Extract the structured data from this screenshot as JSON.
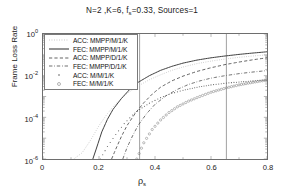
{
  "chart_data": {
    "type": "line",
    "title_parts": {
      "pre": "N=2 ,K=6, f",
      "sub": "s",
      "post": "=0.33, Sources=1"
    },
    "xlabel": "ρ",
    "xlabel_sub": "s",
    "ylabel": "Frame Loss Rate",
    "xlim": [
      0,
      0.8
    ],
    "ylim": [
      1e-06,
      1
    ],
    "yscale": "log",
    "xticks": [
      "0",
      "0.2",
      "0.4",
      "0.6",
      "0.8"
    ],
    "xtick_values": [
      0,
      0.2,
      0.4,
      0.6,
      0.8
    ],
    "yticks": [
      "10^0",
      "10^-2",
      "10^-4",
      "10^-6"
    ],
    "ytick_exponents": [
      "0",
      "-2",
      "-4",
      "-6"
    ],
    "ytick_values": [
      1,
      0.01,
      0.0001,
      1e-06
    ],
    "grid": false,
    "legend_position": "upper left",
    "vertical_reference_lines": [
      0.345,
      0.655
    ],
    "series": [
      {
        "name": "ACC: MMPP/M/1/K",
        "style": "dotted",
        "color": "#b9b9b9",
        "points": [
          [
            0.11,
            1e-06
          ],
          [
            0.14,
            2e-06
          ],
          [
            0.17,
            8e-06
          ],
          [
            0.2,
            4e-05
          ],
          [
            0.23,
            0.00015
          ],
          [
            0.26,
            0.00045
          ],
          [
            0.3,
            0.0014
          ],
          [
            0.34,
            0.0032
          ],
          [
            0.38,
            0.0064
          ],
          [
            0.42,
            0.011
          ],
          [
            0.46,
            0.018
          ],
          [
            0.5,
            0.026
          ],
          [
            0.55,
            0.038
          ],
          [
            0.6,
            0.05
          ],
          [
            0.65,
            0.063
          ],
          [
            0.7,
            0.076
          ],
          [
            0.75,
            0.088
          ],
          [
            0.8,
            0.1
          ]
        ]
      },
      {
        "name": "FEC: MMPP/M/1/K",
        "style": "solid",
        "color": "#3c3c3c",
        "points": [
          [
            0.178,
            1e-06
          ],
          [
            0.19,
            3e-06
          ],
          [
            0.21,
            2e-05
          ],
          [
            0.23,
            8e-05
          ],
          [
            0.25,
            0.00024
          ],
          [
            0.28,
            0.0008
          ],
          [
            0.31,
            0.0022
          ],
          [
            0.34,
            0.0048
          ],
          [
            0.38,
            0.01
          ],
          [
            0.42,
            0.018
          ],
          [
            0.46,
            0.028
          ],
          [
            0.5,
            0.04
          ],
          [
            0.55,
            0.056
          ],
          [
            0.6,
            0.072
          ],
          [
            0.65,
            0.088
          ],
          [
            0.7,
            0.105
          ],
          [
            0.75,
            0.122
          ],
          [
            0.8,
            0.14
          ]
        ]
      },
      {
        "name": "ACC: MMPP/D/1/K",
        "style": "dashed",
        "color": "#474747",
        "points": [
          [
            0.245,
            1e-06
          ],
          [
            0.26,
            3e-06
          ],
          [
            0.28,
            1.2e-05
          ],
          [
            0.3,
            4e-05
          ],
          [
            0.33,
            0.00016
          ],
          [
            0.36,
            0.0005
          ],
          [
            0.39,
            0.0013
          ],
          [
            0.42,
            0.0028
          ],
          [
            0.46,
            0.0056
          ],
          [
            0.5,
            0.0095
          ],
          [
            0.55,
            0.016
          ],
          [
            0.6,
            0.024
          ],
          [
            0.65,
            0.034
          ],
          [
            0.7,
            0.045
          ],
          [
            0.75,
            0.058
          ],
          [
            0.8,
            0.072
          ]
        ]
      },
      {
        "name": "FEC: MMPP/D/1/K",
        "style": "dashdot",
        "color": "#555555",
        "points": [
          [
            0.285,
            1e-06
          ],
          [
            0.3,
            3.5e-06
          ],
          [
            0.32,
            1.3e-05
          ],
          [
            0.34,
            4.2e-05
          ],
          [
            0.37,
            0.00015
          ],
          [
            0.4,
            0.00042
          ],
          [
            0.44,
            0.0011
          ],
          [
            0.48,
            0.0022
          ],
          [
            0.52,
            0.0038
          ],
          [
            0.56,
            0.0056
          ],
          [
            0.6,
            0.0076
          ],
          [
            0.65,
            0.01
          ],
          [
            0.7,
            0.0125
          ],
          [
            0.75,
            0.015
          ],
          [
            0.8,
            0.0175
          ]
        ]
      },
      {
        "name": "ACC: M/M/1/K",
        "style": "dot-marker",
        "color": "#5a5a5a",
        "points": [
          [
            0.205,
            1e-06
          ],
          [
            0.23,
            4e-06
          ],
          [
            0.26,
            1.5e-05
          ],
          [
            0.29,
            5e-05
          ],
          [
            0.32,
            0.00013
          ],
          [
            0.345,
            0.00024
          ],
          [
            0.38,
            0.00048
          ],
          [
            0.42,
            0.00088
          ],
          [
            0.46,
            0.0014
          ],
          [
            0.5,
            0.002
          ],
          [
            0.55,
            0.0028
          ],
          [
            0.6,
            0.0036
          ],
          [
            0.655,
            0.0044
          ],
          [
            0.7,
            0.005
          ],
          [
            0.75,
            0.0056
          ],
          [
            0.8,
            0.0062
          ]
        ]
      },
      {
        "name": "FEC: M/M/1/K",
        "style": "circle-marker",
        "color": "#6b6b6b",
        "points": [
          [
            0.335,
            1e-06
          ],
          [
            0.36,
            6e-06
          ],
          [
            0.39,
            2.6e-05
          ],
          [
            0.42,
            7.5e-05
          ],
          [
            0.45,
            0.00017
          ],
          [
            0.48,
            0.00032
          ],
          [
            0.52,
            0.0006
          ],
          [
            0.56,
            0.001
          ],
          [
            0.6,
            0.0016
          ],
          [
            0.655,
            0.0026
          ],
          [
            0.7,
            0.0036
          ],
          [
            0.75,
            0.0048
          ],
          [
            0.8,
            0.0062
          ]
        ]
      }
    ]
  },
  "legend": {
    "items": [
      {
        "label": "ACC: MMPP/M/1/K",
        "style": "dotted"
      },
      {
        "label": "FEC: MMPP/M/1/K",
        "style": "solid"
      },
      {
        "label": "ACC: MMPP/D/1/K",
        "style": "dashed"
      },
      {
        "label": "FEC: MMPP/D/1/K",
        "style": "dashdot"
      },
      {
        "label": "ACC: M/M/1/K",
        "style": "dot-marker"
      },
      {
        "label": "FEC: M/M/1/K",
        "style": "circle-marker"
      }
    ]
  }
}
